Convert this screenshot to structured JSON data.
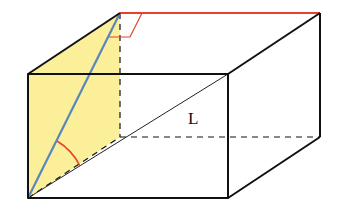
{
  "diagram": {
    "type": "rectangular-prism",
    "label_diagonal": "L",
    "colors": {
      "edge": "#111111",
      "shaded_face": "#fbef9a",
      "space_diagonal_face": "#5a86c0",
      "top_edge_highlight": "#e8402a",
      "angle_arc": "#e8402a",
      "right_angle_marker": "#e8402a"
    },
    "vertices": {
      "front_top_left": [
        28,
        74
      ],
      "front_top_right": [
        228,
        74
      ],
      "front_bottom_left": [
        28,
        198
      ],
      "front_bottom_right": [
        228,
        198
      ],
      "back_top_left": [
        120,
        13
      ],
      "back_top_right": [
        320,
        13
      ],
      "back_bottom_left": [
        120,
        137
      ],
      "back_bottom_right": [
        320,
        137
      ]
    }
  }
}
